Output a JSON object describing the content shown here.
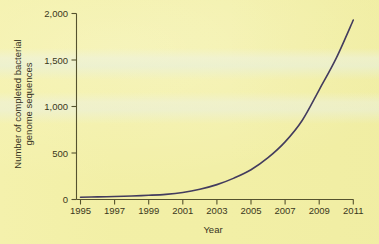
{
  "chart_data": {
    "type": "line",
    "title": "",
    "xlabel": "Year",
    "ylabel": "Number of completed bacterial genome sequences",
    "ylabel_lines": [
      "Number of completed bacterial",
      "genome sequences"
    ],
    "xlim": [
      1995,
      2011
    ],
    "ylim": [
      0,
      2000
    ],
    "grid": false,
    "legend": "none",
    "xticks": [
      1995,
      1997,
      1999,
      2001,
      2003,
      2005,
      2007,
      2009,
      2011
    ],
    "xtick_labels": [
      "1995",
      "1997",
      "1999",
      "2001",
      "2003",
      "2005",
      "2007",
      "2009",
      "2011"
    ],
    "yticks": [
      0,
      500,
      1000,
      1500,
      2000
    ],
    "ytick_labels": [
      "0",
      "500",
      "1,000",
      "1,500",
      "2,000"
    ],
    "series": [
      {
        "name": "Completed bacterial genome sequences",
        "color": "#433c5e",
        "x": [
          1995,
          1996,
          1997,
          1998,
          1999,
          2000,
          2001,
          2002,
          2003,
          2004,
          2005,
          2006,
          2007,
          2008,
          2009,
          2010,
          2011
        ],
        "values": [
          25,
          28,
          32,
          38,
          45,
          55,
          75,
          110,
          160,
          230,
          320,
          450,
          620,
          850,
          1180,
          1520,
          1930
        ]
      }
    ]
  },
  "colors": {
    "background": "#f2efa6",
    "axis": "#55522e",
    "line": "#433c5e",
    "text": "#36331e"
  }
}
